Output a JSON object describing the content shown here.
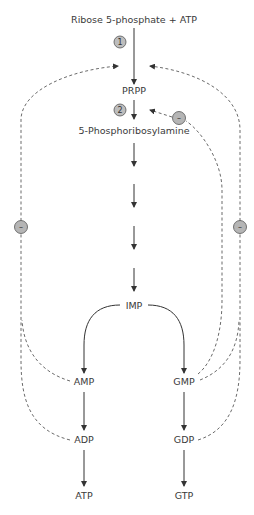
{
  "diagram": {
    "nodes": {
      "start": "Ribose 5-phosphate + ATP",
      "prpp": "PRPP",
      "pra": "5-Phosphoribosylamine",
      "imp": "IMP",
      "amp": "AMP",
      "gmp": "GMP",
      "adp": "ADP",
      "gdp": "GDP",
      "atp": "ATP",
      "gtp": "GTP"
    },
    "steps": {
      "step1": "1",
      "step2": "2"
    },
    "inhibitors": {
      "left": "–",
      "right": "–",
      "inner": "–"
    },
    "edges": [
      {
        "from": "Ribose 5-phosphate + ATP",
        "to": "PRPP",
        "label": "1",
        "style": "solid"
      },
      {
        "from": "PRPP",
        "to": "5-Phosphoribosylamine",
        "label": "2",
        "style": "solid"
      },
      {
        "from": "5-Phosphoribosylamine",
        "to": "IMP",
        "style": "solid",
        "note": "multiple steps"
      },
      {
        "from": "IMP",
        "to": "AMP",
        "style": "solid"
      },
      {
        "from": "IMP",
        "to": "GMP",
        "style": "solid"
      },
      {
        "from": "AMP",
        "to": "ADP",
        "style": "solid"
      },
      {
        "from": "ADP",
        "to": "ATP",
        "style": "solid"
      },
      {
        "from": "GMP",
        "to": "GDP",
        "style": "solid"
      },
      {
        "from": "GDP",
        "to": "GTP",
        "style": "solid"
      },
      {
        "from": "AMP",
        "to": "step1",
        "style": "dashed",
        "type": "inhibition"
      },
      {
        "from": "ADP",
        "to": "step1",
        "style": "dashed",
        "type": "inhibition"
      },
      {
        "from": "GMP",
        "to": "step1",
        "style": "dashed",
        "type": "inhibition"
      },
      {
        "from": "GDP",
        "to": "step1",
        "style": "dashed",
        "type": "inhibition"
      },
      {
        "from": "GMP",
        "to": "step2",
        "style": "dashed",
        "type": "inhibition"
      }
    ],
    "colors": {
      "line": "#333333",
      "circle_fill": "#b5b5b5",
      "circle_stroke": "#555555",
      "text": "#3a3a3a"
    }
  }
}
